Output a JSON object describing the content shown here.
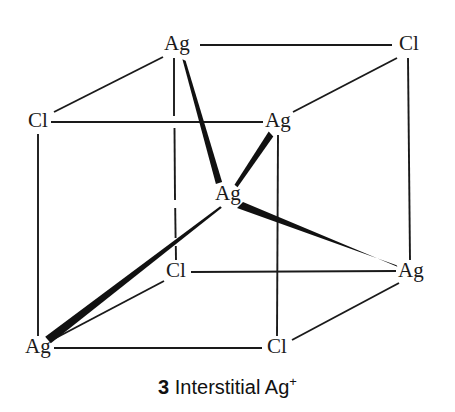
{
  "figure": {
    "caption": {
      "number": "3",
      "text": " Interstitial Ag",
      "superscript": "+",
      "full": "3 Interstitial Ag+"
    },
    "background_color": "#ffffff",
    "line_color": "#1a1a1a",
    "label_color": "#1a1a1a"
  },
  "atoms": [
    {
      "id": "top-ag",
      "label": "Ag",
      "species": "Ag",
      "x": 177,
      "y": 45,
      "role": "lattice-cation"
    },
    {
      "id": "top-right-cl",
      "label": "Cl",
      "species": "Cl",
      "x": 409,
      "y": 45,
      "role": "lattice-anion"
    },
    {
      "id": "left-cl",
      "label": "Cl",
      "species": "Cl",
      "x": 38,
      "y": 122,
      "role": "lattice-anion"
    },
    {
      "id": "mid-right-ag",
      "label": "Ag",
      "species": "Ag",
      "x": 278,
      "y": 122,
      "role": "lattice-cation"
    },
    {
      "id": "interstitial-ag",
      "label": "Ag",
      "species": "Ag",
      "x": 228,
      "y": 195,
      "role": "interstitial-cation"
    },
    {
      "id": "inner-cl",
      "label": "Cl",
      "species": "Cl",
      "x": 176,
      "y": 272,
      "role": "lattice-anion"
    },
    {
      "id": "right-ag",
      "label": "Ag",
      "species": "Ag",
      "x": 411,
      "y": 272,
      "role": "lattice-cation"
    },
    {
      "id": "bottom-left-ag",
      "label": "Ag",
      "species": "Ag",
      "x": 38,
      "y": 348,
      "role": "lattice-cation"
    },
    {
      "id": "bottom-cl",
      "label": "Cl",
      "species": "Cl",
      "x": 277,
      "y": 348,
      "role": "lattice-anion"
    }
  ],
  "bonds": {
    "thin": [
      {
        "from": "top-ag",
        "to": "top-right-cl",
        "x1": 200,
        "y1": 45,
        "x2": 392,
        "y2": 45
      },
      {
        "from": "top-ag",
        "to": "left-cl",
        "x1": 163,
        "y1": 57,
        "x2": 54,
        "y2": 112
      },
      {
        "from": "top-right-cl",
        "to": "mid-right-ag",
        "x1": 397,
        "y1": 58,
        "x2": 293,
        "y2": 112
      },
      {
        "from": "left-cl",
        "to": "mid-right-ag",
        "x1": 51,
        "y1": 122,
        "x2": 263,
        "y2": 122
      },
      {
        "from": "left-cl",
        "to": "bottom-left-ag",
        "x1": 38,
        "y1": 134,
        "x2": 38,
        "y2": 336
      },
      {
        "from": "top-ag",
        "to": "inner-cl",
        "x1": 174,
        "y1": 58,
        "x2": 176,
        "y2": 260
      },
      {
        "from": "mid-right-ag",
        "to": "bottom-cl",
        "x1": 278,
        "y1": 135,
        "x2": 277,
        "y2": 336
      },
      {
        "from": "top-right-cl",
        "to": "right-ag",
        "x1": 408,
        "y1": 58,
        "x2": 410,
        "y2": 260
      },
      {
        "from": "inner-cl",
        "to": "right-ag",
        "x1": 191,
        "y1": 272,
        "x2": 396,
        "y2": 271
      },
      {
        "from": "inner-cl",
        "to": "bottom-left-ag",
        "x1": 164,
        "y1": 281,
        "x2": 52,
        "y2": 340
      },
      {
        "from": "bottom-left-ag",
        "to": "bottom-cl",
        "x1": 54,
        "y1": 348,
        "x2": 262,
        "y2": 348
      },
      {
        "from": "bottom-cl",
        "to": "right-ag",
        "x1": 292,
        "y1": 340,
        "x2": 399,
        "y2": 283
      }
    ],
    "thick": [
      {
        "from": "top-ag",
        "to": "interstitial-ag",
        "x1": 184,
        "y1": 60,
        "x2": 219,
        "y2": 183,
        "w1": 3.2,
        "w2": 6.2
      },
      {
        "from": "mid-right-ag",
        "to": "interstitial-ag",
        "x1": 271,
        "y1": 134,
        "x2": 236,
        "y2": 186,
        "w1": 5.6,
        "w2": 3.0
      },
      {
        "from": "interstitial-ag",
        "to": "right-ag",
        "x1": 240,
        "y1": 205,
        "x2": 397,
        "y2": 266,
        "w1": 6.4,
        "w2": 1.6
      },
      {
        "from": "interstitial-ag",
        "to": "bottom-left-ag",
        "x1": 221,
        "y1": 207,
        "x2": 48,
        "y2": 340,
        "w1": 1.6,
        "w2": 6.4
      }
    ]
  },
  "legend": {
    "thin_meaning": "normal lattice bond",
    "thick_meaning": "bond to interstitial Ag+ ion"
  }
}
